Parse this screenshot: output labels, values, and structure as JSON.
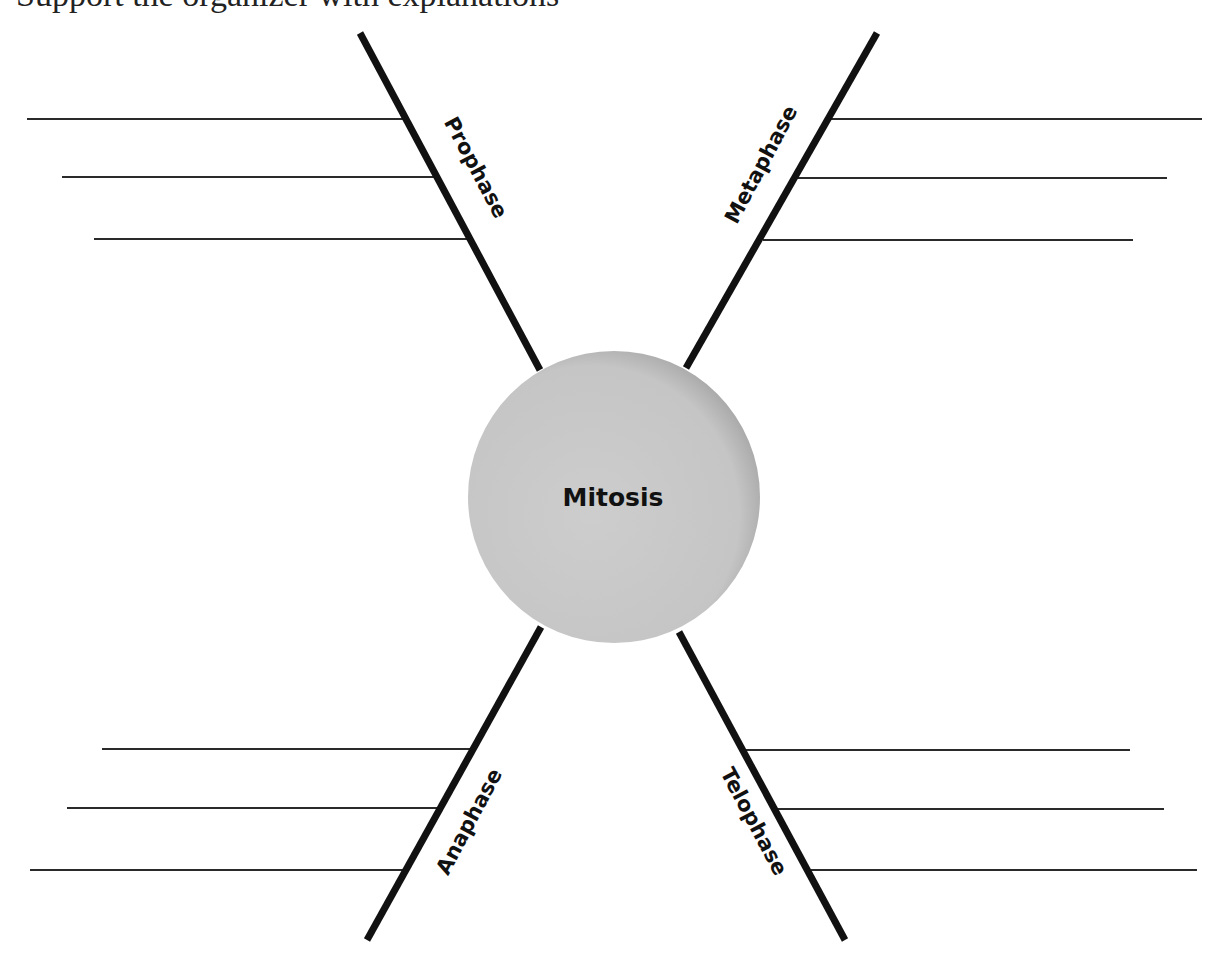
{
  "header": {
    "cropped_text": "Support the organizer with explanations"
  },
  "diagram": {
    "center": {
      "label": "Mitosis",
      "cx": 614,
      "cy": 497,
      "r": 146,
      "fill_light": "#cacaca",
      "fill_dark": "#a6a6a6"
    },
    "arm_color": "#111111",
    "line_color": "#2a2a2a",
    "arms": [
      {
        "id": "prophase",
        "label": "Prophase",
        "x1": 360,
        "y1": 33,
        "x2": 540,
        "y2": 370,
        "label_x": 475,
        "label_y": 168,
        "label_rotate": 62,
        "lines": [
          {
            "x1": 27,
            "x2": 404,
            "y": 119
          },
          {
            "x1": 62,
            "x2": 436,
            "y": 177
          },
          {
            "x1": 94,
            "x2": 468,
            "y": 239
          }
        ]
      },
      {
        "id": "metaphase",
        "label": "Metaphase",
        "x1": 877,
        "y1": 33,
        "x2": 686,
        "y2": 368,
        "label_x": 762,
        "label_y": 165,
        "label_rotate": -62,
        "lines": [
          {
            "x1": 831,
            "x2": 1202,
            "y": 119
          },
          {
            "x1": 797,
            "x2": 1167,
            "y": 178
          },
          {
            "x1": 763,
            "x2": 1133,
            "y": 240
          }
        ]
      },
      {
        "id": "anaphase",
        "label": "Anaphase",
        "x1": 541,
        "y1": 627,
        "x2": 367,
        "y2": 940,
        "label_x": 470,
        "label_y": 822,
        "label_rotate": -62,
        "lines": [
          {
            "x1": 102,
            "x2": 472,
            "y": 749
          },
          {
            "x1": 67,
            "x2": 438,
            "y": 808
          },
          {
            "x1": 30,
            "x2": 404,
            "y": 870
          }
        ]
      },
      {
        "id": "telophase",
        "label": "Telophase",
        "x1": 679,
        "y1": 632,
        "x2": 845,
        "y2": 940,
        "label_x": 753,
        "label_y": 822,
        "label_rotate": 62,
        "lines": [
          {
            "x1": 746,
            "x2": 1130,
            "y": 750
          },
          {
            "x1": 778,
            "x2": 1164,
            "y": 809
          },
          {
            "x1": 811,
            "x2": 1197,
            "y": 870
          }
        ]
      }
    ]
  }
}
